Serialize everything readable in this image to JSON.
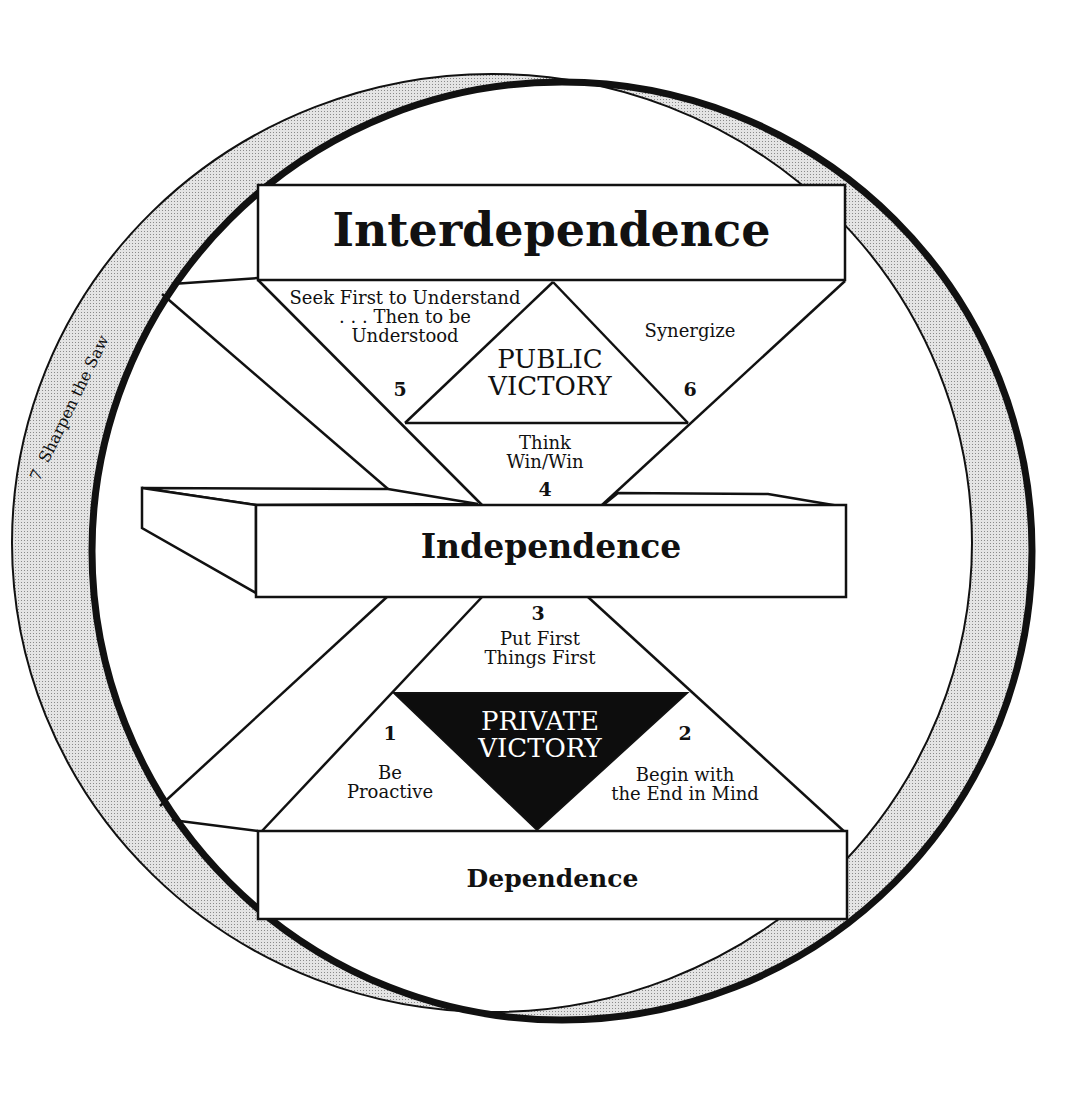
{
  "diagram": {
    "type": "habits-maturity-continuum",
    "levels": {
      "top": "Interdependence",
      "middle": "Independence",
      "bottom": "Dependence"
    },
    "victories": {
      "public": [
        "PUBLIC",
        "VICTORY"
      ],
      "private": [
        "PRIVATE",
        "VICTORY"
      ]
    },
    "habits": [
      {
        "number": "1",
        "lines": [
          "Be",
          "Proactive"
        ]
      },
      {
        "number": "2",
        "lines": [
          "Begin with",
          "the End in Mind"
        ]
      },
      {
        "number": "3",
        "lines": [
          "Put First",
          "Things First"
        ]
      },
      {
        "number": "4",
        "lines": [
          "Think",
          "Win/Win"
        ]
      },
      {
        "number": "5",
        "lines": [
          "Seek First to Understand",
          ". . . Then to be",
          "Understood"
        ]
      },
      {
        "number": "6",
        "lines": [
          "Synergize"
        ]
      },
      {
        "number": "7",
        "label": "Sharpen the Saw"
      }
    ],
    "colors": {
      "line": "#111111",
      "ring_shade": "#d6d6d6",
      "private_fill": "#0d0d0d",
      "private_text": "#ffffff"
    }
  }
}
